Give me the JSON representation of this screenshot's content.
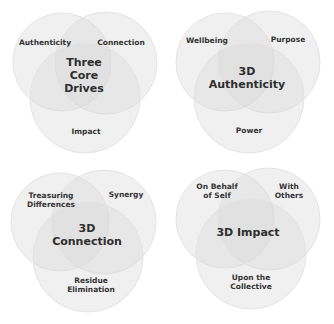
{
  "colors": {
    "circle_fill": "#d8d8d8",
    "circle_stroke": "#e4e4e4",
    "text": "#333333"
  },
  "diagrams": [
    {
      "title": "Three\nCore\nDrives",
      "labels": {
        "left": "Authenticity",
        "right": "Connection",
        "bottom": "Impact"
      }
    },
    {
      "title": "3D\nAuthenticity",
      "labels": {
        "left": "Wellbeing",
        "right": "Purpose",
        "bottom": "Power"
      }
    },
    {
      "title": "3D\nConnection",
      "labels": {
        "left": "Treasuring\nDifferences",
        "right": "Synergy",
        "bottom": "Residue\nElimination"
      }
    },
    {
      "title": "3D Impact",
      "labels": {
        "left": "On Behalf\nof Self",
        "right": "With\nOthers",
        "bottom": "Upon the\nCollective"
      }
    }
  ]
}
